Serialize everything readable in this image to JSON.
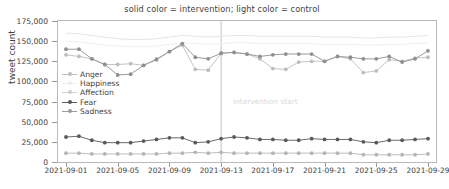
{
  "chart_data": {
    "type": "line",
    "title": "solid color = intervention; light color = control",
    "xlabel": "",
    "ylabel": "tweet count",
    "ylim": [
      0,
      175000
    ],
    "ytick_labels": [
      "0",
      "25,000",
      "50,000",
      "75,000",
      "100,000",
      "125,000",
      "150,000",
      "175,000"
    ],
    "ytick_values": [
      0,
      25000,
      50000,
      75000,
      100000,
      125000,
      150000,
      175000
    ],
    "xtick_labels": [
      "2021-09-01",
      "2021-09-05",
      "2021-09-09",
      "2021-09-13",
      "2021-09-17",
      "2021-09-21",
      "2021-09-25",
      "2021-09-29"
    ],
    "x": [
      "2021-09-01",
      "2021-09-02",
      "2021-09-03",
      "2021-09-04",
      "2021-09-05",
      "2021-09-06",
      "2021-09-07",
      "2021-09-08",
      "2021-09-09",
      "2021-09-10",
      "2021-09-11",
      "2021-09-12",
      "2021-09-13",
      "2021-09-14",
      "2021-09-15",
      "2021-09-16",
      "2021-09-17",
      "2021-09-18",
      "2021-09-19",
      "2021-09-20",
      "2021-09-21",
      "2021-09-22",
      "2021-09-23",
      "2021-09-24",
      "2021-09-25",
      "2021-09-26",
      "2021-09-27",
      "2021-09-28",
      "2021-09-29"
    ],
    "grid": false,
    "legend_position": "upper-left-inside",
    "legend": [
      "Anger",
      "Happiness",
      "Affection",
      "Fear",
      "Sadness"
    ],
    "annotations": [
      {
        "text": "intervention start",
        "x": "2021-09-13",
        "type": "vline",
        "color": "#c8c8c8"
      }
    ],
    "series": [
      {
        "name": "Anger intervention",
        "color": "#8f8f8f",
        "style": "solid",
        "values": [
          140000,
          140000,
          128000,
          121000,
          108000,
          109000,
          120000,
          127000,
          137000,
          147000,
          130000,
          128000,
          135000,
          136000,
          134000,
          131000,
          133000,
          134000,
          134000,
          134000,
          125000,
          131000,
          130000,
          128000,
          128000,
          131000,
          124000,
          128000,
          138000
        ]
      },
      {
        "name": "Anger control",
        "color": "#bdbdbd",
        "style": "solid",
        "values": [
          133000,
          131000,
          128000,
          121000,
          121000,
          122000,
          120000,
          128000,
          137000,
          145000,
          115000,
          114000,
          135000,
          136000,
          134000,
          128000,
          116000,
          115000,
          124000,
          125000,
          125000,
          131000,
          128000,
          111000,
          113000,
          127000,
          125000,
          129000,
          130000
        ]
      },
      {
        "name": "Happiness band upper",
        "color": "#e2e2e2",
        "style": "solid",
        "values": [
          160000,
          159000,
          157000,
          155000,
          153000,
          152000,
          152000,
          153000,
          155000,
          157000,
          156000,
          155000,
          156000,
          157000,
          157000,
          156000,
          156000,
          156000,
          156000,
          156000,
          155000,
          155000,
          155000,
          154000,
          154000,
          155000,
          155000,
          156000,
          157000
        ]
      },
      {
        "name": "Affection band",
        "color": "#ededed",
        "style": "solid",
        "values": [
          150000,
          149000,
          147000,
          145000,
          144000,
          143000,
          143000,
          144000,
          146000,
          148000,
          147000,
          146000,
          147000,
          148000,
          148000,
          147000,
          147000,
          147000,
          147000,
          147000,
          146000,
          146000,
          146000,
          145000,
          145000,
          146000,
          146000,
          147000,
          148000
        ]
      },
      {
        "name": "Fear intervention",
        "color": "#595959",
        "style": "solid",
        "values": [
          31000,
          32000,
          27000,
          24000,
          24000,
          24000,
          26000,
          28000,
          30000,
          30000,
          24000,
          25000,
          29000,
          31000,
          30000,
          28000,
          28000,
          27000,
          27000,
          29000,
          28000,
          28000,
          28000,
          25000,
          24000,
          27000,
          27000,
          28000,
          29000
        ]
      },
      {
        "name": "Sadness control",
        "color": "#b5b5b5",
        "style": "solid",
        "values": [
          11000,
          11000,
          10000,
          10000,
          10000,
          10000,
          10000,
          10000,
          11000,
          11000,
          12000,
          11000,
          12000,
          11000,
          11000,
          11000,
          11000,
          11000,
          11000,
          11000,
          11000,
          11000,
          11000,
          9000,
          9000,
          9000,
          9000,
          9000,
          10000
        ]
      }
    ]
  },
  "legend": {
    "items": [
      {
        "label": "Anger",
        "color": "#bdbdbd",
        "marker": "circle"
      },
      {
        "label": "Happiness",
        "color": "#ededed",
        "marker": "circle"
      },
      {
        "label": "Affection",
        "color": "#cfcfcf",
        "marker": "circle"
      },
      {
        "label": "Fear",
        "color": "#595959",
        "marker": "circle"
      },
      {
        "label": "Sadness",
        "color": "#9a9a9a",
        "marker": "circle"
      }
    ]
  },
  "annotation": {
    "intervention_label": "intervention start"
  },
  "colors": {
    "axis": "#9a9a9a",
    "frame": "#b9b9b9",
    "text": "#3f3f3f",
    "vline": "#c8c8c8"
  }
}
